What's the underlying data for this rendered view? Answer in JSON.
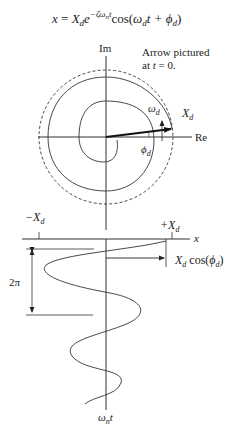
{
  "equation": {
    "lhs": "x",
    "eq": " = ",
    "amp": "X",
    "amp_sub": "d",
    "exp_base": "e",
    "exp_pow": "−ζω",
    "exp_pow_sub": "n",
    "exp_pow_t": "t",
    "func": "cos(",
    "omega": "ω",
    "omega_sub": "d",
    "t": "t + ",
    "phi": "ϕ",
    "phi_sub": "d",
    "close": ")"
  },
  "phasor_diagram": {
    "axis_im_label": "Im",
    "axis_re_label": "Re",
    "note_line1": "Arrow pictured",
    "note_line2_pre": "at ",
    "note_line2_var": "t",
    "note_line2_post": " = 0.",
    "omega_label": "ω",
    "omega_sub": "d",
    "amp_label": "X",
    "amp_sub": "d",
    "phi_label": "ϕ",
    "phi_sub": "d"
  },
  "time_plot": {
    "neg_amp_label": "−X",
    "neg_amp_sub": "d",
    "pos_amp_label": "+X",
    "pos_amp_sub": "d",
    "x_axis_label": "x",
    "period_label": "2π",
    "initial_label": "X",
    "initial_sub": "d",
    "initial_func": " cos(",
    "initial_phi": "ϕ",
    "initial_phi_sub": "d",
    "initial_close": ")",
    "time_axis_label": "ω",
    "time_axis_sub": "n",
    "time_axis_t": "t"
  }
}
